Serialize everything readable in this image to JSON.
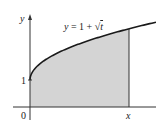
{
  "figure": {
    "equation_label": "y = 1 + √t",
    "y_axis_label": "y",
    "x_tick_label": "x",
    "origin_label": "0",
    "y_tick_label": "1",
    "fill_color": "#d4d4d4",
    "curve_color": "#1a1a1a",
    "axis_color": "#333333"
  },
  "chart_data": {
    "type": "area",
    "title": "y = 1 + √t",
    "function": "y = 1 + sqrt(t)",
    "xlabel": "t",
    "ylabel": "y",
    "x_ticks": [
      "0",
      "x"
    ],
    "y_ticks": [
      "1"
    ],
    "shaded_region": "area under y = 1 + √t from t = 0 to t = x",
    "points": [
      {
        "t": 0,
        "y": 1
      },
      {
        "t": 1,
        "y": 2
      },
      {
        "t": 2,
        "y": 2.41
      },
      {
        "t": 3,
        "y": 2.73
      },
      {
        "t": 3.6,
        "y": 2.9
      },
      {
        "t": 4.5,
        "y": 3.12
      }
    ],
    "xlim": [
      -0.7,
      4.5
    ],
    "ylim": [
      -0.6,
      3.4
    ],
    "grid": false
  }
}
